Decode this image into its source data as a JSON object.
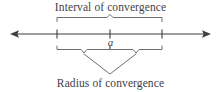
{
  "figure": {
    "title_top": "Interval of convergence",
    "title_bottom": "Radius of convergence",
    "center_label": "a",
    "line_color": "#3f3f42",
    "brace_color": "#6e6e73",
    "text_color": "#3f3f42",
    "background": "#ffffff"
  },
  "axis": {
    "left_arrow_tip_x": 10,
    "right_arrow_tip_x": 211,
    "y": 34,
    "ticks": [
      {
        "name": "left-endpoint",
        "x": 57
      },
      {
        "name": "center-a",
        "x": 110
      },
      {
        "name": "right-endpoint",
        "x": 162
      }
    ]
  },
  "braces": {
    "interval": {
      "from_x": 57,
      "to_x": 162,
      "y": 21,
      "peak_x": 110,
      "peak_y": 16
    },
    "radius_left": {
      "from_x": 57,
      "to_x": 110,
      "y": 48,
      "nub_x": 84,
      "nub_y": 53
    },
    "radius_right": {
      "from_x": 110,
      "to_x": 162,
      "y": 48,
      "nub_x": 136,
      "nub_y": 53
    },
    "leader_vertex": {
      "x": 110,
      "y": 74
    }
  }
}
